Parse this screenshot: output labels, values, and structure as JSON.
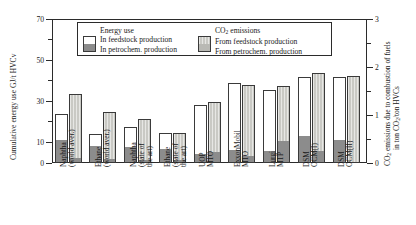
{
  "chart_data": {
    "type": "bar",
    "title": "",
    "subtitle": "",
    "ylabel": "Cumulative energy use GJ/t HVCv",
    "ylabel_right_line1": "CO2 emissions due to combustion of fuels",
    "ylabel_right_line2": "in ton CO2/ton HVCs",
    "xlabel": "",
    "ylim": [
      0,
      70
    ],
    "y2lim": [
      0,
      3
    ],
    "yticks": [
      0,
      10,
      30,
      50,
      70
    ],
    "yticks_minor": [
      5,
      15,
      20,
      25,
      35,
      40,
      45,
      55,
      60,
      65
    ],
    "y2ticks": [
      0,
      1,
      2,
      3
    ],
    "y2ticks_minor": [
      0.5,
      1.5,
      2.5
    ],
    "grid": false,
    "legend_position": "top-center",
    "categories": [
      "Naphtha (world aver.)",
      "Ethane (world aver.)",
      "Naphtha (state of the art)",
      "Ethane (state of the art)",
      "UOP MTO",
      "ExxonMobil MTO",
      "Lurgi MTP",
      "DSM OCM(I)",
      "DSM OCM(II)"
    ],
    "category_lines": [
      [
        "Naphtha",
        "(world aver.)"
      ],
      [
        "Ethane",
        "(world aver.)"
      ],
      [
        "Naphtha",
        "(state of",
        "the art)"
      ],
      [
        "Ethane",
        "(state of",
        "the art)"
      ],
      [
        "UOP",
        "MTO"
      ],
      [
        "ExxonMobil",
        "MTO"
      ],
      [
        "Lurgi",
        "MTP"
      ],
      [
        "DSM",
        "OCM(I)"
      ],
      [
        "DSM",
        "OCM(II)"
      ]
    ],
    "series": [
      {
        "name": "Energy use in petrochem. production",
        "axis": "left",
        "unit": "GJ/t HVCv",
        "values": [
          11.0,
          8.5,
          8.0,
          7.0,
          4.0,
          6.0,
          5.5,
          13.0,
          11.0
        ]
      },
      {
        "name": "Energy use in feedstock production",
        "axis": "left",
        "unit": "GJ/t HVCv",
        "values": [
          13.0,
          5.5,
          9.5,
          7.5,
          24.5,
          33.0,
          30.0,
          29.0,
          31.0
        ]
      },
      {
        "name": "CO2 emissions from petrochem. production",
        "axis": "right",
        "unit": "ton CO2/ton HVCs",
        "values": [
          0.08,
          0.07,
          0.05,
          0.05,
          0.22,
          0.13,
          0.46,
          0.23,
          0.0
        ]
      },
      {
        "name": "CO2 emissions from feedstock production",
        "axis": "right",
        "unit": "ton CO2/ton HVCs",
        "values": [
          1.36,
          1.01,
          0.87,
          0.58,
          1.07,
          1.5,
          1.15,
          1.65,
          1.83
        ]
      }
    ],
    "totals_energy": [
      24.0,
      14.0,
      17.5,
      14.5,
      28.5,
      39.0,
      35.5,
      42.0,
      42.0
    ],
    "totals_co2": [
      1.44,
      1.08,
      0.92,
      0.63,
      1.29,
      1.63,
      1.61,
      1.88,
      1.83
    ]
  },
  "legend": {
    "energy_heading": "Energy use",
    "energy_items": [
      "In feedstock production",
      "In petrochem. production"
    ],
    "co2_heading_prefix": "CO",
    "co2_heading_sub": "2",
    "co2_heading_suffix": " emissions",
    "co2_items": [
      "From feedstock production",
      "From petrochem. production"
    ]
  },
  "axis_text": {
    "left_title": "Cumulative energy use GJ/t HVCv",
    "right_title_a": "CO",
    "right_title_a_sub": "2",
    "right_title_b": " emissions due to combustion of fuels",
    "right_title_c": "in ton CO",
    "right_title_c_sub": "2",
    "right_title_d": "/ton HVCs",
    "left_ticks": [
      "0",
      "10",
      "30",
      "50",
      "70"
    ],
    "right_ticks": [
      "0",
      "1",
      "2",
      "3"
    ]
  }
}
